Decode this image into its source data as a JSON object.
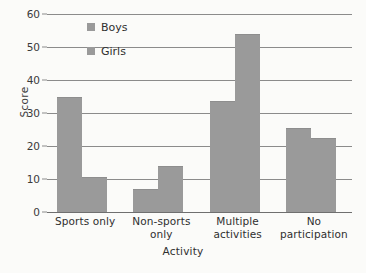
{
  "chart_data": {
    "type": "bar",
    "title": "",
    "xlabel": "Activity",
    "ylabel": "Score",
    "ylim": [
      0,
      60
    ],
    "yticks": [
      0,
      10,
      20,
      30,
      40,
      50,
      60
    ],
    "grid": true,
    "legend_position": "top-left-inside",
    "categories": [
      "Sports only",
      "Non-sports only",
      "Multiple activities",
      "No participation"
    ],
    "category_lines": [
      [
        "Sports only"
      ],
      [
        "Non-sports",
        "only"
      ],
      [
        "Multiple",
        "activities"
      ],
      [
        "No",
        "participation"
      ]
    ],
    "series": [
      {
        "name": "Boys",
        "color": "#9a9a9a",
        "values": [
          35,
          7,
          33.5,
          25.5
        ]
      },
      {
        "name": "Girls",
        "color": "#9a9a9a",
        "values": [
          10.5,
          14,
          54,
          22.5
        ]
      }
    ]
  },
  "legend": {
    "items": [
      {
        "label": "Boys",
        "swatch_color": "#9a9a9a"
      },
      {
        "label": "Girls",
        "swatch_color": "#9a9a9a"
      }
    ]
  },
  "axes": {
    "y_title": "Score",
    "x_title": "Activity",
    "y_tick_labels": [
      "0",
      "10",
      "20",
      "30",
      "40",
      "50",
      "60"
    ]
  },
  "colors": {
    "background": "#fbfbf9",
    "bar": "#9a9a9a",
    "gridline": "#8b8b8b",
    "text": "#2f2f2f"
  }
}
